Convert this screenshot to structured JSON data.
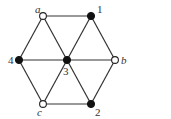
{
  "diagram": {
    "type": "graph",
    "nodes": [
      {
        "id": "a",
        "label": "a",
        "x": 43,
        "y": 16,
        "filled": false,
        "label_x": 35,
        "label_y": 13,
        "italic": true
      },
      {
        "id": "1",
        "label": "1",
        "x": 91,
        "y": 16,
        "filled": true,
        "label_x": 97,
        "label_y": 13,
        "italic": false
      },
      {
        "id": "4",
        "label": "4",
        "x": 19,
        "y": 60,
        "filled": true,
        "label_x": 8,
        "label_y": 64,
        "italic": false
      },
      {
        "id": "3",
        "label": "3",
        "x": 67,
        "y": 60,
        "filled": true,
        "label_x": 63,
        "label_y": 75,
        "italic": false
      },
      {
        "id": "b",
        "label": "b",
        "x": 115,
        "y": 60,
        "filled": false,
        "label_x": 121,
        "label_y": 64,
        "italic": true
      },
      {
        "id": "c",
        "label": "c",
        "x": 43,
        "y": 104,
        "filled": false,
        "label_x": 37,
        "label_y": 116,
        "italic": true
      },
      {
        "id": "2",
        "label": "2",
        "x": 91,
        "y": 104,
        "filled": true,
        "label_x": 95,
        "label_y": 116,
        "italic": false
      }
    ],
    "edges": [
      [
        "a",
        "1"
      ],
      [
        "a",
        "4"
      ],
      [
        "a",
        "3"
      ],
      [
        "1",
        "3"
      ],
      [
        "1",
        "b"
      ],
      [
        "4",
        "3"
      ],
      [
        "3",
        "b"
      ],
      [
        "4",
        "c"
      ],
      [
        "3",
        "c"
      ],
      [
        "3",
        "2"
      ],
      [
        "b",
        "2"
      ],
      [
        "c",
        "2"
      ]
    ]
  }
}
